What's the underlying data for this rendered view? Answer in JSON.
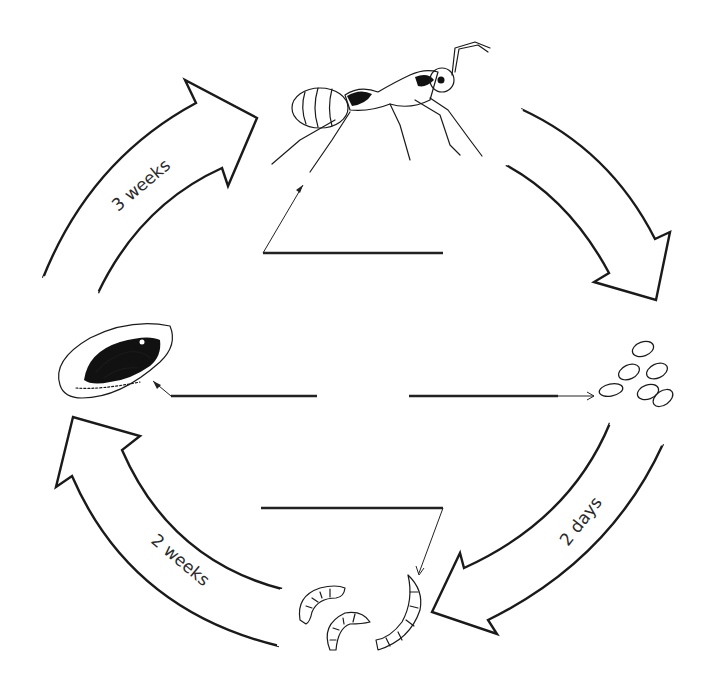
{
  "diagram": {
    "type": "life-cycle",
    "stages": [
      {
        "id": "adult",
        "name": "adult ant",
        "position": "top",
        "label": ""
      },
      {
        "id": "eggs",
        "name": "eggs",
        "position": "right",
        "label": ""
      },
      {
        "id": "larvae",
        "name": "larvae",
        "position": "bottom",
        "label": ""
      },
      {
        "id": "pupa",
        "name": "pupa (cocoon)",
        "position": "left",
        "label": ""
      }
    ],
    "transitions": [
      {
        "from": "adult",
        "to": "eggs",
        "label": ""
      },
      {
        "from": "eggs",
        "to": "larvae",
        "label": "2 days"
      },
      {
        "from": "larvae",
        "to": "pupa",
        "label": "2 weeks"
      },
      {
        "from": "pupa",
        "to": "adult",
        "label": "3 weeks"
      }
    ]
  },
  "labels": {
    "top_left_arrow": "3 weeks",
    "bottom_right_arrow": "2 days",
    "bottom_left_arrow": "2 weeks"
  },
  "colors": {
    "stroke": "#1a1a1a",
    "background": "#ffffff"
  }
}
